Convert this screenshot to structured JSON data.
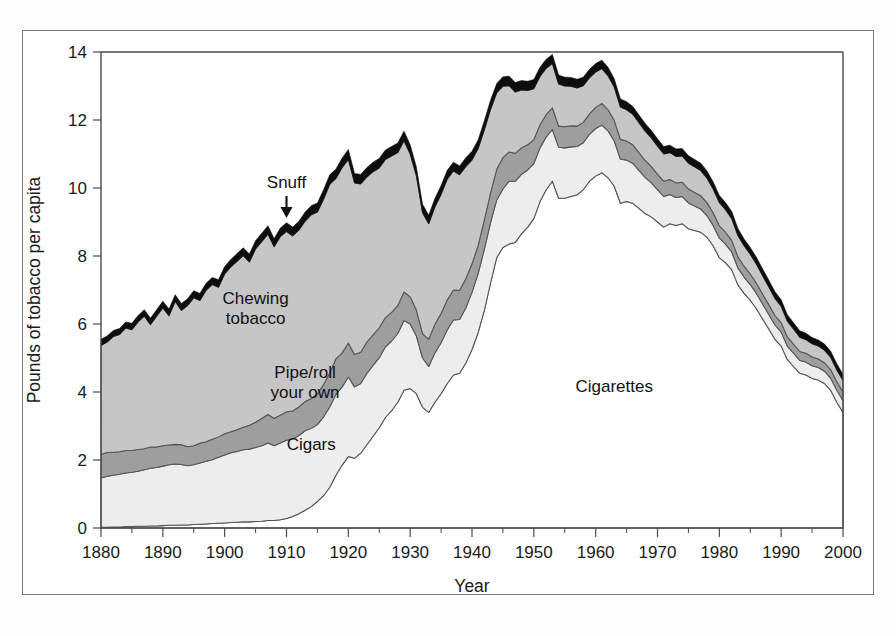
{
  "figure": {
    "background": "#ffffff",
    "frame_color": "#7b7b7b"
  },
  "chart_data": {
    "type": "area",
    "stacked": true,
    "title": "",
    "xlabel": "Year",
    "ylabel": "Pounds of tobacco per capita",
    "xlim": [
      1880,
      2000
    ],
    "ylim": [
      0,
      14
    ],
    "ytick_labels": [
      "0",
      "2",
      "4",
      "6",
      "8",
      "10",
      "12",
      "14"
    ],
    "ytick_values": [
      0,
      2,
      4,
      6,
      8,
      10,
      12,
      14
    ],
    "xtick_labels": [
      "1880",
      "1890",
      "1900",
      "1910",
      "1920",
      "1930",
      "1940",
      "1950",
      "1960",
      "1970",
      "1980",
      "1990",
      "2000"
    ],
    "xtick_values": [
      1880,
      1890,
      1900,
      1910,
      1920,
      1930,
      1940,
      1950,
      1960,
      1970,
      1980,
      1990,
      2000
    ],
    "minor_tick_interval": 5,
    "grid": false,
    "legend_position": "inline-annotations",
    "annotations": [
      {
        "name": "snuff",
        "label": "Snuff",
        "x": 1910,
        "y": 10.0,
        "arrow": "down"
      },
      {
        "name": "chewing-tobacco",
        "label": "Chewing tobacco",
        "x": 1905,
        "y": 6.6,
        "arrow": "none"
      },
      {
        "name": "pipe-roll-your-own",
        "label": "Pipe/roll your own",
        "x": 1913,
        "y": 4.4,
        "arrow": "none"
      },
      {
        "name": "cigars",
        "label": "Cigars",
        "x": 1914,
        "y": 2.3,
        "arrow": "none"
      },
      {
        "name": "cigarettes",
        "label": "Cigarettes",
        "x": 1963,
        "y": 4.0,
        "arrow": "none"
      }
    ],
    "series_order_bottom_to_top": [
      "Cigarettes",
      "Cigars",
      "Pipe/roll your own",
      "Chewing tobacco",
      "Snuff"
    ],
    "colors": {
      "Cigarettes": "#ffffff",
      "Cigars": "#ededed",
      "Pipe/roll your own": "#9e9e9e",
      "Chewing tobacco": "#c6c6c6",
      "Snuff": "#0d0d0d"
    },
    "x": [
      1880,
      1881,
      1882,
      1883,
      1884,
      1885,
      1886,
      1887,
      1888,
      1889,
      1890,
      1891,
      1892,
      1893,
      1894,
      1895,
      1896,
      1897,
      1898,
      1899,
      1900,
      1901,
      1902,
      1903,
      1904,
      1905,
      1906,
      1907,
      1908,
      1909,
      1910,
      1911,
      1912,
      1913,
      1914,
      1915,
      1916,
      1917,
      1918,
      1919,
      1920,
      1921,
      1922,
      1923,
      1924,
      1925,
      1926,
      1927,
      1928,
      1929,
      1930,
      1931,
      1932,
      1933,
      1934,
      1935,
      1936,
      1937,
      1938,
      1939,
      1940,
      1941,
      1942,
      1943,
      1944,
      1945,
      1946,
      1947,
      1948,
      1949,
      1950,
      1951,
      1952,
      1953,
      1954,
      1955,
      1956,
      1957,
      1958,
      1959,
      1960,
      1961,
      1962,
      1963,
      1964,
      1965,
      1966,
      1967,
      1968,
      1969,
      1970,
      1971,
      1972,
      1973,
      1974,
      1975,
      1976,
      1977,
      1978,
      1979,
      1980,
      1981,
      1982,
      1983,
      1984,
      1985,
      1986,
      1987,
      1988,
      1989,
      1990,
      1991,
      1992,
      1993,
      1994,
      1995,
      1996,
      1997,
      1998,
      1999,
      2000
    ],
    "series": [
      {
        "name": "Cigarettes",
        "values": [
          0.02,
          0.02,
          0.03,
          0.03,
          0.04,
          0.04,
          0.05,
          0.05,
          0.06,
          0.06,
          0.07,
          0.08,
          0.08,
          0.09,
          0.09,
          0.1,
          0.11,
          0.12,
          0.13,
          0.14,
          0.15,
          0.16,
          0.17,
          0.18,
          0.18,
          0.19,
          0.2,
          0.22,
          0.22,
          0.24,
          0.28,
          0.34,
          0.42,
          0.52,
          0.63,
          0.78,
          0.95,
          1.2,
          1.55,
          1.85,
          2.1,
          2.05,
          2.2,
          2.45,
          2.7,
          2.95,
          3.25,
          3.45,
          3.7,
          4.05,
          4.1,
          3.95,
          3.55,
          3.4,
          3.7,
          3.95,
          4.25,
          4.5,
          4.55,
          4.85,
          5.25,
          5.75,
          6.4,
          7.2,
          7.95,
          8.25,
          8.35,
          8.4,
          8.65,
          8.85,
          9.1,
          9.6,
          9.95,
          10.2,
          9.7,
          9.7,
          9.75,
          9.8,
          9.95,
          10.2,
          10.35,
          10.45,
          10.3,
          10.05,
          9.55,
          9.6,
          9.55,
          9.4,
          9.25,
          9.15,
          9.0,
          8.85,
          8.95,
          8.9,
          8.95,
          8.8,
          8.75,
          8.7,
          8.55,
          8.3,
          7.95,
          7.8,
          7.6,
          7.15,
          6.9,
          6.7,
          6.45,
          6.15,
          5.85,
          5.55,
          5.35,
          4.95,
          4.75,
          4.55,
          4.5,
          4.4,
          4.35,
          4.25,
          4.05,
          3.7,
          3.4
        ]
      },
      {
        "name": "Cigars",
        "values": [
          1.45,
          1.5,
          1.52,
          1.55,
          1.58,
          1.6,
          1.62,
          1.66,
          1.7,
          1.72,
          1.75,
          1.78,
          1.8,
          1.78,
          1.74,
          1.76,
          1.8,
          1.84,
          1.88,
          1.94,
          2.0,
          2.05,
          2.08,
          2.12,
          2.14,
          2.18,
          2.22,
          2.28,
          2.2,
          2.26,
          2.3,
          2.28,
          2.3,
          2.34,
          2.3,
          2.26,
          2.32,
          2.36,
          2.38,
          2.3,
          2.34,
          2.1,
          2.05,
          2.1,
          2.08,
          2.06,
          2.08,
          2.05,
          2.02,
          2.05,
          1.9,
          1.7,
          1.45,
          1.35,
          1.45,
          1.5,
          1.58,
          1.62,
          1.58,
          1.62,
          1.68,
          1.74,
          1.8,
          1.78,
          1.7,
          1.72,
          1.85,
          1.8,
          1.75,
          1.68,
          1.62,
          1.58,
          1.55,
          1.52,
          1.5,
          1.48,
          1.46,
          1.42,
          1.38,
          1.38,
          1.4,
          1.4,
          1.38,
          1.34,
          1.3,
          1.22,
          1.18,
          1.12,
          1.06,
          1.0,
          0.95,
          0.9,
          0.86,
          0.82,
          0.8,
          0.76,
          0.72,
          0.68,
          0.64,
          0.6,
          0.58,
          0.55,
          0.52,
          0.5,
          0.48,
          0.46,
          0.45,
          0.44,
          0.43,
          0.42,
          0.41,
          0.4,
          0.39,
          0.38,
          0.38,
          0.37,
          0.37,
          0.36,
          0.36,
          0.35,
          0.35
        ]
      },
      {
        "name": "Pipe/roll your own",
        "values": [
          0.7,
          0.7,
          0.68,
          0.66,
          0.66,
          0.64,
          0.64,
          0.62,
          0.62,
          0.6,
          0.6,
          0.58,
          0.58,
          0.58,
          0.56,
          0.56,
          0.58,
          0.58,
          0.6,
          0.6,
          0.62,
          0.62,
          0.64,
          0.66,
          0.7,
          0.74,
          0.8,
          0.84,
          0.8,
          0.82,
          0.84,
          0.82,
          0.84,
          0.86,
          0.88,
          0.9,
          0.95,
          1.0,
          1.05,
          1.0,
          1.0,
          0.95,
          0.92,
          0.92,
          0.9,
          0.88,
          0.86,
          0.84,
          0.82,
          0.84,
          0.8,
          0.76,
          0.72,
          0.8,
          0.84,
          0.86,
          0.88,
          0.88,
          0.86,
          0.86,
          0.84,
          0.82,
          0.86,
          0.88,
          0.9,
          0.92,
          0.86,
          0.82,
          0.78,
          0.74,
          0.7,
          0.68,
          0.66,
          0.64,
          0.62,
          0.62,
          0.62,
          0.6,
          0.6,
          0.6,
          0.62,
          0.64,
          0.62,
          0.6,
          0.58,
          0.56,
          0.54,
          0.52,
          0.5,
          0.48,
          0.46,
          0.45,
          0.44,
          0.43,
          0.42,
          0.41,
          0.4,
          0.39,
          0.38,
          0.37,
          0.36,
          0.35,
          0.34,
          0.33,
          0.32,
          0.31,
          0.3,
          0.29,
          0.29,
          0.28,
          0.28,
          0.27,
          0.27,
          0.26,
          0.26,
          0.26,
          0.25,
          0.25,
          0.25,
          0.25,
          0.25
        ]
      },
      {
        "name": "Chewing tobacco",
        "values": [
          3.2,
          3.25,
          3.4,
          3.45,
          3.6,
          3.55,
          3.75,
          3.9,
          3.6,
          3.85,
          4.05,
          3.8,
          4.2,
          3.95,
          4.15,
          4.35,
          4.2,
          4.45,
          4.55,
          4.4,
          4.7,
          4.85,
          4.95,
          5.05,
          4.8,
          5.1,
          5.2,
          5.3,
          5.05,
          5.25,
          5.3,
          5.15,
          5.2,
          5.3,
          5.4,
          5.35,
          5.45,
          5.55,
          5.3,
          5.45,
          5.4,
          5.05,
          4.95,
          4.85,
          4.8,
          4.7,
          4.65,
          4.6,
          4.5,
          4.45,
          4.2,
          3.95,
          3.55,
          3.4,
          3.45,
          3.5,
          3.55,
          3.5,
          3.4,
          3.3,
          3.05,
          2.85,
          2.65,
          2.45,
          2.25,
          2.1,
          1.95,
          1.8,
          1.7,
          1.6,
          1.5,
          1.42,
          1.36,
          1.3,
          1.24,
          1.2,
          1.16,
          1.12,
          1.08,
          1.06,
          1.04,
          1.02,
          1.0,
          0.98,
          0.95,
          0.92,
          0.9,
          0.88,
          0.86,
          0.84,
          0.82,
          0.8,
          0.79,
          0.78,
          0.77,
          0.76,
          0.75,
          0.74,
          0.72,
          0.7,
          0.68,
          0.66,
          0.64,
          0.62,
          0.6,
          0.58,
          0.56,
          0.54,
          0.52,
          0.5,
          0.48,
          0.46,
          0.44,
          0.42,
          0.4,
          0.39,
          0.38,
          0.37,
          0.36,
          0.35,
          0.34
        ]
      },
      {
        "name": "Snuff",
        "values": [
          0.18,
          0.18,
          0.18,
          0.18,
          0.18,
          0.19,
          0.19,
          0.19,
          0.19,
          0.19,
          0.2,
          0.2,
          0.2,
          0.2,
          0.2,
          0.21,
          0.21,
          0.21,
          0.21,
          0.22,
          0.22,
          0.22,
          0.23,
          0.23,
          0.24,
          0.24,
          0.25,
          0.25,
          0.24,
          0.25,
          0.26,
          0.26,
          0.26,
          0.27,
          0.27,
          0.27,
          0.28,
          0.28,
          0.28,
          0.28,
          0.29,
          0.28,
          0.28,
          0.28,
          0.28,
          0.28,
          0.28,
          0.28,
          0.28,
          0.28,
          0.27,
          0.26,
          0.25,
          0.25,
          0.25,
          0.26,
          0.26,
          0.26,
          0.26,
          0.26,
          0.26,
          0.26,
          0.27,
          0.27,
          0.27,
          0.28,
          0.28,
          0.28,
          0.28,
          0.27,
          0.27,
          0.27,
          0.27,
          0.27,
          0.26,
          0.26,
          0.26,
          0.26,
          0.25,
          0.25,
          0.25,
          0.25,
          0.25,
          0.24,
          0.24,
          0.24,
          0.23,
          0.23,
          0.23,
          0.22,
          0.22,
          0.22,
          0.22,
          0.22,
          0.22,
          0.22,
          0.22,
          0.22,
          0.21,
          0.21,
          0.21,
          0.21,
          0.21,
          0.21,
          0.2,
          0.2,
          0.2,
          0.2,
          0.2,
          0.2,
          0.19,
          0.19,
          0.19,
          0.19,
          0.19,
          0.18,
          0.18,
          0.18,
          0.18,
          0.18,
          0.18
        ]
      }
    ]
  }
}
